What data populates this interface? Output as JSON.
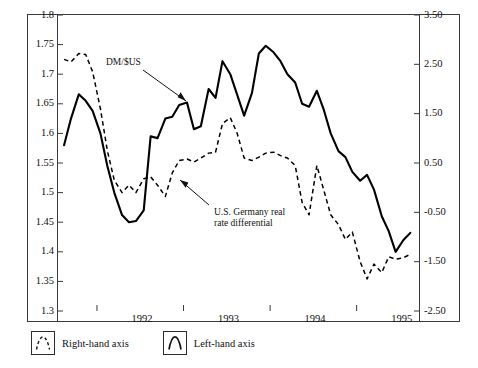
{
  "chart_data": {
    "type": "line",
    "title": "",
    "xlabel": "",
    "ylabel": "",
    "grid": false,
    "legend_position": "below-plot",
    "x_tick_labels": [
      "1992",
      "1993",
      "1994",
      "1995"
    ],
    "x_tick_values": [
      1992,
      1993,
      1994,
      1995
    ],
    "xlim": [
      1991.55,
      1995.72
    ],
    "left_axis": {
      "label": "DM/$US",
      "ylim": [
        1.3,
        1.8
      ],
      "tick_labels": [
        "1.8",
        "1.75",
        "1.7",
        "1.65",
        "1.6",
        "1.55",
        "1.5",
        "1.45",
        "1.4",
        "1.35",
        "1.3"
      ],
      "tick_values": [
        1.8,
        1.75,
        1.7,
        1.65,
        1.6,
        1.55,
        1.5,
        1.45,
        1.4,
        1.35,
        1.3
      ]
    },
    "right_axis": {
      "label": "U.S. Germany real rate differential",
      "ylim": [
        -2.5,
        3.5
      ],
      "tick_labels": [
        "3.50",
        "2.50",
        "1.50",
        "0.50",
        "-0.50",
        "-1.50",
        "-2.50"
      ],
      "tick_values": [
        3.5,
        2.5,
        1.5,
        0.5,
        -0.5,
        -1.5,
        -2.5
      ]
    },
    "series": [
      {
        "name": "DM/$US",
        "axis": "left",
        "style": "solid",
        "color": "#000000",
        "x": [
          1991.62,
          1991.7,
          1991.79,
          1991.87,
          1991.95,
          1992.04,
          1992.12,
          1992.2,
          1992.29,
          1992.37,
          1992.45,
          1992.54,
          1992.62,
          1992.7,
          1992.79,
          1992.87,
          1992.95,
          1993.04,
          1993.12,
          1993.2,
          1993.29,
          1993.37,
          1993.45,
          1993.54,
          1993.62,
          1993.7,
          1993.79,
          1993.87,
          1993.95,
          1994.04,
          1994.12,
          1994.2,
          1994.29,
          1994.37,
          1994.45,
          1994.54,
          1994.62,
          1994.7,
          1994.79,
          1994.87,
          1994.95,
          1995.04,
          1995.12,
          1995.2,
          1995.29,
          1995.37,
          1995.45,
          1995.54,
          1995.62
        ],
        "y": [
          1.58,
          1.625,
          1.666,
          1.655,
          1.638,
          1.6,
          1.545,
          1.5,
          1.462,
          1.45,
          1.452,
          1.47,
          1.595,
          1.592,
          1.625,
          1.628,
          1.648,
          1.652,
          1.607,
          1.612,
          1.675,
          1.66,
          1.722,
          1.7,
          1.665,
          1.63,
          1.668,
          1.735,
          1.748,
          1.737,
          1.722,
          1.7,
          1.686,
          1.65,
          1.645,
          1.672,
          1.64,
          1.6,
          1.57,
          1.56,
          1.535,
          1.52,
          1.53,
          1.505,
          1.46,
          1.435,
          1.4,
          1.42,
          1.432
        ]
      },
      {
        "name": "U.S. Germany real rate differential",
        "axis": "right",
        "style": "dashed",
        "color": "#000000",
        "x": [
          1991.62,
          1991.7,
          1991.79,
          1991.87,
          1991.95,
          1992.04,
          1992.12,
          1992.2,
          1992.29,
          1992.37,
          1992.45,
          1992.54,
          1992.62,
          1992.7,
          1992.79,
          1992.87,
          1992.95,
          1993.04,
          1993.12,
          1993.2,
          1993.29,
          1993.37,
          1993.45,
          1993.54,
          1993.62,
          1993.7,
          1993.79,
          1993.87,
          1993.95,
          1994.04,
          1994.12,
          1994.2,
          1994.29,
          1994.37,
          1994.45,
          1994.54,
          1994.62,
          1994.7,
          1994.79,
          1994.87,
          1994.95,
          1995.04,
          1995.12,
          1995.2,
          1995.29,
          1995.37,
          1995.45,
          1995.54,
          1995.62
        ],
        "y": [
          2.6,
          2.55,
          2.72,
          2.7,
          2.35,
          1.6,
          0.75,
          0.15,
          -0.1,
          0.05,
          -0.1,
          0.18,
          0.22,
          0.05,
          -0.18,
          0.3,
          0.55,
          0.58,
          0.52,
          0.6,
          0.7,
          0.72,
          1.3,
          1.42,
          1.1,
          0.6,
          0.55,
          0.62,
          0.7,
          0.72,
          0.65,
          0.6,
          0.45,
          -0.3,
          -0.55,
          0.45,
          -0.05,
          -0.55,
          -0.75,
          -1.05,
          -0.9,
          -1.5,
          -1.85,
          -1.55,
          -1.72,
          -1.4,
          -1.45,
          -1.42,
          -1.35
        ]
      }
    ],
    "annotations": [
      {
        "name": "dm-usd-annotation",
        "text": "DM/$US",
        "arrow": "down-right"
      },
      {
        "name": "rate-differential-annotation",
        "text": "U.S. Germany real\nrate differential",
        "arrow": "up-left"
      }
    ]
  },
  "legend": {
    "items": [
      {
        "label": "Right-hand axis",
        "style": "dashed",
        "glyph": "peak-arc-icon"
      },
      {
        "label": "Left-hand axis",
        "style": "solid",
        "glyph": "peak-arc-icon"
      }
    ]
  }
}
